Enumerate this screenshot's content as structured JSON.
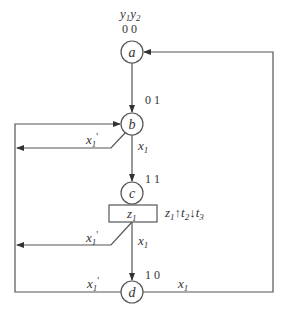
{
  "diagram": {
    "type": "ASM / state flow diagram",
    "header": {
      "var1": "y",
      "var1_sub": "1",
      "var2": "y",
      "var2_sub": "2"
    },
    "states": [
      {
        "id": "a",
        "label": "a",
        "code": "0 0"
      },
      {
        "id": "b",
        "label": "b",
        "code": "0 1"
      },
      {
        "id": "c",
        "label": "c",
        "code": "1 1"
      },
      {
        "id": "d",
        "label": "d",
        "code": "1 0"
      }
    ],
    "output_box": {
      "label": "z",
      "label_sub": "1"
    },
    "annotation": {
      "z": "z",
      "z_sub": "1",
      "up_arrow": "↑",
      "t2": "t",
      "t2_sub": "2",
      "down_arrow": "↓",
      "t3": "t",
      "t3_sub": "3"
    },
    "edges": {
      "b_true": {
        "var": "x",
        "sub": "1",
        "prime": ""
      },
      "b_false": {
        "var": "x",
        "sub": "1",
        "prime": "'"
      },
      "box_true": {
        "var": "x",
        "sub": "1",
        "prime": ""
      },
      "box_false": {
        "var": "x",
        "sub": "1",
        "prime": "'"
      },
      "d_false": {
        "var": "x",
        "sub": "1",
        "prime": "'"
      },
      "d_true": {
        "var": "x",
        "sub": "1",
        "prime": ""
      }
    }
  }
}
